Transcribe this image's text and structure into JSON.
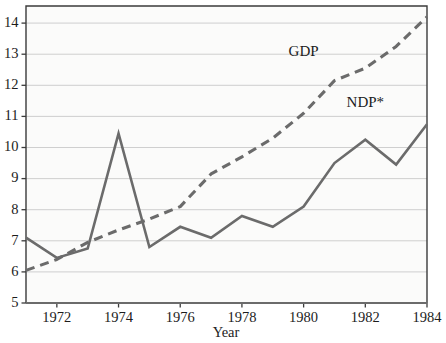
{
  "chart_data": {
    "type": "line",
    "title": "",
    "subtitle": "",
    "xlabel": "Year",
    "ylabel": "",
    "x": [
      1971,
      1972,
      1973,
      1974,
      1975,
      1976,
      1977,
      1978,
      1979,
      1980,
      1981,
      1982,
      1983,
      1984
    ],
    "xlim": [
      1971,
      1984
    ],
    "ylim": [
      5,
      14.55
    ],
    "xticks": [
      1972,
      1974,
      1976,
      1978,
      1980,
      1982,
      1984
    ],
    "xtick_labels": [
      "1972",
      "1974",
      "1976",
      "1978",
      "1980",
      "1982",
      "1984"
    ],
    "yticks": [
      5,
      6,
      7,
      8,
      9,
      10,
      11,
      12,
      13,
      14
    ],
    "ytick_labels": [
      "5",
      "6",
      "7",
      "8",
      "9",
      "10",
      "11",
      "12",
      "13",
      "14"
    ],
    "grid": "horizontal",
    "legend_position": "inline-annotations",
    "series": [
      {
        "name": "GDP",
        "style": "dashed",
        "color": "#6b6b6b",
        "label_text": "GDP",
        "label_x": 1980.0,
        "label_y": 12.95,
        "values": [
          6.05,
          6.4,
          6.95,
          7.35,
          7.7,
          8.1,
          9.15,
          9.7,
          10.3,
          11.1,
          12.15,
          12.55,
          13.25,
          14.2
        ]
      },
      {
        "name": "NDP*",
        "style": "solid",
        "color": "#6b6b6b",
        "label_text": "NDP*",
        "label_x": 1982.0,
        "label_y": 11.3,
        "values": [
          7.1,
          6.45,
          6.75,
          10.45,
          6.8,
          7.45,
          7.1,
          7.8,
          7.45,
          8.1,
          9.5,
          10.25,
          9.45,
          10.75
        ]
      }
    ]
  },
  "axis": {
    "x_title": "Year",
    "y_title": ""
  },
  "colors": {
    "background": "#ffffff",
    "plot_background": "#fbfbfa",
    "axis": "#3b3b3b",
    "grid": "#c9c9c9",
    "series_line": "#6b6b6b",
    "text": "#1c1c1c"
  }
}
